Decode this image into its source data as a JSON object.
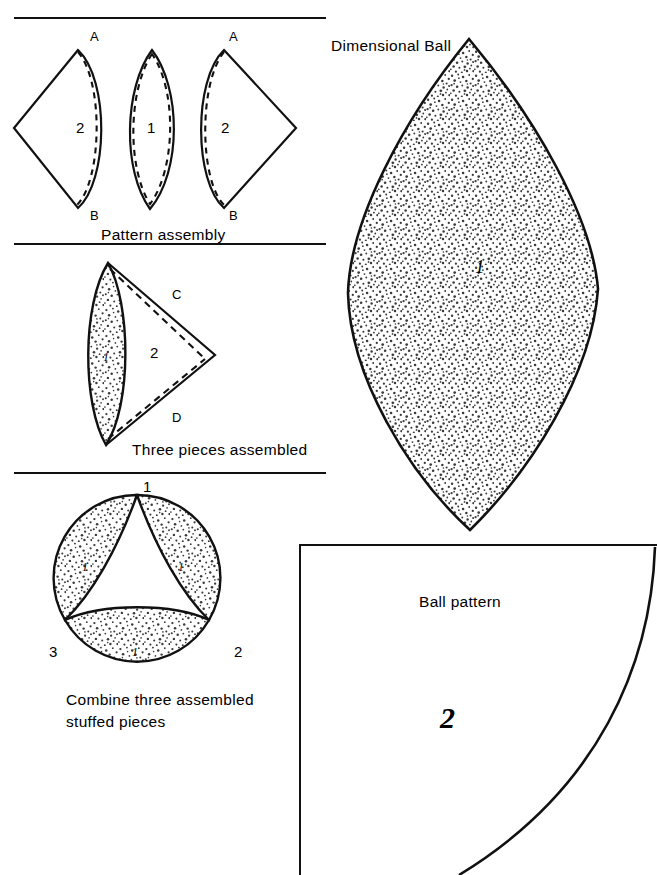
{
  "page": {
    "width": 657,
    "height": 875,
    "background": "#ffffff",
    "ink": "#111111",
    "stipple_color": "#3a3a3a"
  },
  "sections": {
    "pattern_assembly": {
      "caption": "Pattern assembly",
      "vertex_labels": {
        "top_left": "A",
        "top_right": "A",
        "bottom_left": "B",
        "bottom_right": "B"
      },
      "piece_labels": {
        "left": "2",
        "middle": "1",
        "right": "2"
      }
    },
    "three_pieces": {
      "caption": "Three pieces assembled",
      "edge_labels": {
        "upper": "C",
        "lower": "D"
      },
      "piece_labels": {
        "lens": "1",
        "triangle": "2"
      }
    },
    "combine": {
      "caption_line1": "Combine three assembled",
      "caption_line2": "stuffed pieces",
      "position_labels": {
        "top": "1",
        "right": "2",
        "left": "3"
      },
      "piece_labels": {
        "left_petal": "1",
        "right_petal": "1",
        "bottom_petal": "1"
      }
    },
    "dimensional_ball": {
      "title": "Dimensional Ball",
      "piece_label": "1"
    },
    "ball_pattern": {
      "title": "Ball pattern",
      "piece_label": "2"
    }
  }
}
